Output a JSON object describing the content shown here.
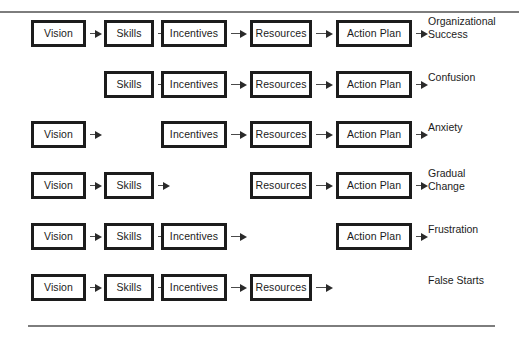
{
  "diagram": {
    "columns": [
      "Vision",
      "Skills",
      "Incentives",
      "Resources",
      "Action Plan"
    ],
    "column_x": [
      31,
      104,
      161,
      250,
      336
    ],
    "column_w": [
      55,
      50,
      66,
      62,
      76
    ],
    "outcome_x": 428,
    "rows": [
      {
        "id": "row-organizational-success",
        "y": 14,
        "cells": [
          {
            "label": "Vision",
            "present": true,
            "arrow": true
          },
          {
            "label": "Skills",
            "present": true,
            "arrow": true
          },
          {
            "label": "Incentives",
            "present": true,
            "arrow": true
          },
          {
            "label": "Resources",
            "present": true,
            "arrow": true
          },
          {
            "label": "Action Plan",
            "present": true,
            "arrow": true
          }
        ],
        "outcome": "Organizational\nSuccess",
        "outcome_lines": 2
      },
      {
        "id": "row-confusion",
        "y": 65,
        "cells": [
          {
            "label": "Vision",
            "present": false,
            "arrow": false
          },
          {
            "label": "Skills",
            "present": true,
            "arrow": true
          },
          {
            "label": "Incentives",
            "present": true,
            "arrow": true
          },
          {
            "label": "Resources",
            "present": true,
            "arrow": true
          },
          {
            "label": "Action Plan",
            "present": true,
            "arrow": true
          }
        ],
        "outcome": "Confusion",
        "outcome_lines": 1
      },
      {
        "id": "row-anxiety",
        "y": 115,
        "cells": [
          {
            "label": "Vision",
            "present": true,
            "arrow": true
          },
          {
            "label": "Skills",
            "present": false,
            "arrow": false
          },
          {
            "label": "Incentives",
            "present": true,
            "arrow": true
          },
          {
            "label": "Resources",
            "present": true,
            "arrow": true
          },
          {
            "label": "Action Plan",
            "present": true,
            "arrow": true
          }
        ],
        "outcome": "Anxiety",
        "outcome_lines": 1
      },
      {
        "id": "row-gradual-change",
        "y": 166,
        "cells": [
          {
            "label": "Vision",
            "present": true,
            "arrow": true
          },
          {
            "label": "Skills",
            "present": true,
            "arrow": true
          },
          {
            "label": "Incentives",
            "present": false,
            "arrow": false
          },
          {
            "label": "Resources",
            "present": true,
            "arrow": true
          },
          {
            "label": "Action Plan",
            "present": true,
            "arrow": true
          }
        ],
        "outcome": "Gradual\nChange",
        "outcome_lines": 2
      },
      {
        "id": "row-frustration",
        "y": 217,
        "cells": [
          {
            "label": "Vision",
            "present": true,
            "arrow": true
          },
          {
            "label": "Skills",
            "present": true,
            "arrow": true
          },
          {
            "label": "Incentives",
            "present": true,
            "arrow": true
          },
          {
            "label": "Resources",
            "present": false,
            "arrow": false
          },
          {
            "label": "Action Plan",
            "present": true,
            "arrow": true
          }
        ],
        "outcome": "Frustration",
        "outcome_lines": 1
      },
      {
        "id": "row-false-starts",
        "y": 268,
        "cells": [
          {
            "label": "Vision",
            "present": true,
            "arrow": true
          },
          {
            "label": "Skills",
            "present": true,
            "arrow": true
          },
          {
            "label": "Incentives",
            "present": true,
            "arrow": true
          },
          {
            "label": "Resources",
            "present": true,
            "arrow": true
          },
          {
            "label": "Action Plan",
            "present": false,
            "arrow": false
          }
        ],
        "outcome": "False Starts",
        "outcome_lines": 1
      }
    ],
    "colors": {
      "box_border": "#1c1c1c",
      "arrow": "#2a2a2a",
      "rule": "#7d7d7d",
      "text": "#1b1b1b",
      "background": "#ffffff"
    }
  }
}
